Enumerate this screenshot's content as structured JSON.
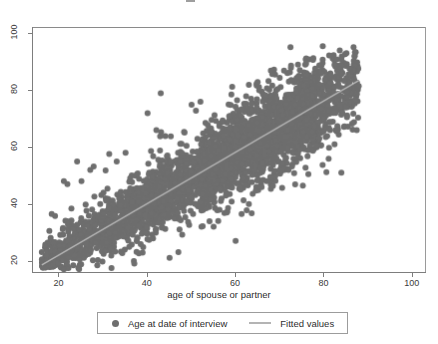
{
  "figure": {
    "background_color": "#ffffff",
    "title_remnant": "",
    "point_color": "#6e6e6e",
    "line_color": "#b4b4b4",
    "axis_color": "#7d7d7d"
  },
  "axes": {
    "x": {
      "label": "age of spouse or partner",
      "ticks": [
        20,
        40,
        60,
        80,
        100
      ],
      "tick_labels": [
        "20",
        "40",
        "60",
        "80",
        "100"
      ],
      "min": 14,
      "max": 103
    },
    "y": {
      "label": "",
      "ticks": [
        20,
        40,
        60,
        80,
        100
      ],
      "tick_labels": [
        "20",
        "40",
        "60",
        "80",
        "100"
      ],
      "min": 16,
      "max": 102
    }
  },
  "legend": {
    "entries": [
      {
        "marker": "circle-marker",
        "label": "Age at date of interview",
        "color": "#6e6e6e"
      },
      {
        "marker": "line-marker",
        "label": "Fitted values",
        "color": "#b4b4b4"
      }
    ]
  },
  "chart_data": {
    "type": "scatter",
    "title": "",
    "xlabel": "age of spouse or partner",
    "ylabel": "",
    "xlim": [
      14,
      103
    ],
    "ylim": [
      16,
      102
    ],
    "xticks": [
      20,
      40,
      60,
      80,
      100
    ],
    "yticks": [
      20,
      40,
      60,
      80,
      100
    ],
    "grid": false,
    "legend_position": "below-axis",
    "series": [
      {
        "name": "Age at date of interview",
        "type": "scatter",
        "color": "#6e6e6e",
        "marker_size": 6,
        "n_points_approx": 3200,
        "description": "Dense positively-correlated cloud of respondent age vs spouse/partner age; band runs from about (17,18) at the lower left to about (88,88) at the upper right, widening in the middle ages.",
        "cloud": {
          "x_range": [
            16,
            88
          ],
          "y_range": [
            18,
            92
          ],
          "core_band_halfwidth": 5,
          "correlation_approx": 0.93,
          "density_peak_x": [
            55,
            72
          ]
        },
        "notable_outliers": [
          {
            "x": 16,
            "y": 23
          },
          {
            "x": 18,
            "y": 28
          },
          {
            "x": 21,
            "y": 48
          },
          {
            "x": 25,
            "y": 48
          },
          {
            "x": 21,
            "y": 17
          },
          {
            "x": 24,
            "y": 55
          },
          {
            "x": 27,
            "y": 52
          },
          {
            "x": 30,
            "y": 44
          },
          {
            "x": 33,
            "y": 55
          },
          {
            "x": 35,
            "y": 58
          },
          {
            "x": 37,
            "y": 19
          },
          {
            "x": 40,
            "y": 72
          },
          {
            "x": 43,
            "y": 79
          },
          {
            "x": 42,
            "y": 66
          },
          {
            "x": 45,
            "y": 21
          },
          {
            "x": 47,
            "y": 23
          },
          {
            "x": 50,
            "y": 75
          },
          {
            "x": 52,
            "y": 76
          },
          {
            "x": 55,
            "y": 32
          },
          {
            "x": 58,
            "y": 37
          },
          {
            "x": 60,
            "y": 27
          },
          {
            "x": 63,
            "y": 40
          },
          {
            "x": 63,
            "y": 82
          },
          {
            "x": 65,
            "y": 83
          },
          {
            "x": 68,
            "y": 87
          },
          {
            "x": 71,
            "y": 87
          },
          {
            "x": 70,
            "y": 52
          },
          {
            "x": 72,
            "y": 52
          },
          {
            "x": 79,
            "y": 63
          },
          {
            "x": 84,
            "y": 51
          },
          {
            "x": 84,
            "y": 91
          },
          {
            "x": 87,
            "y": 92
          },
          {
            "x": 83,
            "y": 66
          }
        ]
      },
      {
        "name": "Fitted values",
        "type": "line",
        "color": "#b4b4b4",
        "points": [
          [
            16,
            18.5
          ],
          [
            88,
            83.5
          ]
        ],
        "slope_approx": 0.9,
        "intercept_approx": 4.0
      }
    ]
  }
}
